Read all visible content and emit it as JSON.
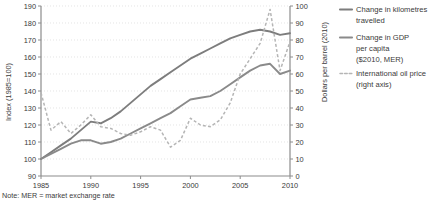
{
  "chart_data": {
    "type": "line",
    "title": "",
    "xlabel": "",
    "ylabel": "Index (1985=100)",
    "y2label": "Dollars per barrel (2010)",
    "grid": true,
    "legend_position": "right",
    "xlim": [
      1985,
      2010
    ],
    "ylim": [
      90,
      190
    ],
    "y2lim": [
      0,
      100
    ],
    "xticks": [
      1985,
      1990,
      1995,
      2000,
      2005,
      2010
    ],
    "yticks": [
      90,
      100,
      110,
      120,
      130,
      140,
      150,
      160,
      170,
      180,
      190
    ],
    "y2ticks": [
      0,
      10,
      20,
      30,
      40,
      50,
      60,
      70,
      80,
      90,
      100
    ],
    "x": [
      1985,
      1986,
      1987,
      1988,
      1989,
      1990,
      1991,
      1992,
      1993,
      1994,
      1995,
      1996,
      1997,
      1998,
      1999,
      2000,
      2001,
      2002,
      2003,
      2004,
      2005,
      2006,
      2007,
      2008,
      2009,
      2010
    ],
    "series": [
      {
        "name": "Change in kilometres travelled",
        "axis": "left",
        "style": "solid",
        "color": "#7d7d7d",
        "values": [
          100,
          104,
          108,
          112,
          117,
          122,
          121,
          124,
          128,
          133,
          138,
          143,
          147,
          151,
          155,
          159,
          162,
          165,
          168,
          171,
          173,
          175,
          176,
          175,
          173,
          174
        ]
      },
      {
        "name": "Change in GDP per capita ($2010, MER)",
        "axis": "left",
        "style": "solid",
        "color": "#8a8a8a",
        "values": [
          100,
          103,
          106,
          109,
          111,
          111,
          109,
          110,
          112,
          115,
          118,
          121,
          124,
          127,
          131,
          135,
          136,
          137,
          140,
          144,
          148,
          152,
          155,
          156,
          150,
          152
        ]
      },
      {
        "name": "International oil price (right axis)",
        "axis": "right",
        "style": "dashed",
        "color": "#b5b5b5",
        "values": [
          49,
          27,
          32,
          25,
          30,
          36,
          29,
          28,
          25,
          24,
          26,
          29,
          27,
          17,
          21,
          34,
          30,
          29,
          33,
          43,
          60,
          69,
          78,
          98,
          62,
          79
        ]
      }
    ]
  },
  "legend": {
    "items": [
      {
        "label_line1": "Change in kilometres",
        "label_line2": "travelled",
        "label_line3": "",
        "style": "solid",
        "color": "#7d7d7d"
      },
      {
        "label_line1": "Change in GDP",
        "label_line2": "per capita",
        "label_line3": "($2010, MER)",
        "style": "solid",
        "color": "#8a8a8a"
      },
      {
        "label_line1": "International oil price",
        "label_line2": "(right axis)",
        "label_line3": "",
        "style": "dashed",
        "color": "#b5b5b5"
      }
    ]
  },
  "note": {
    "text": "Note: MER = market exchange rate"
  },
  "axes": {
    "left_title": "Index (1985=100)",
    "right_title": "Dollars per barrel (2010)"
  }
}
